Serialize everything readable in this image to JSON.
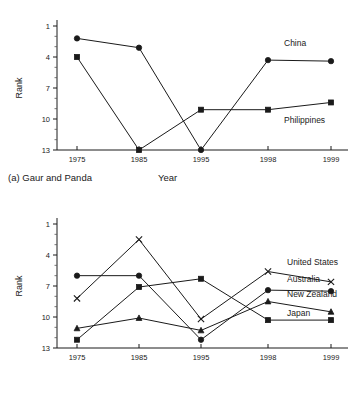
{
  "figure": {
    "axis_title_y": "Rank",
    "axis_title_x": "Year",
    "caption_a": "(a) Gaur and Panda",
    "caption_b": "(b) Elephants"
  },
  "chart_data": [
    {
      "type": "line",
      "title": "(a) Gaur and Panda",
      "xlabel": "Year",
      "ylabel": "Rank",
      "categories": [
        "1975",
        "1985",
        "1995",
        "1998",
        "1999"
      ],
      "yticks": [
        1,
        4,
        7,
        10,
        13
      ],
      "ylim": [
        13,
        1
      ],
      "y_inverted": true,
      "grid": false,
      "legend": "inline-right",
      "series": [
        {
          "name": "China",
          "marker": "filled-circle",
          "values": [
            2.2,
            3.1,
            13.0,
            4.3,
            4.4
          ]
        },
        {
          "name": "Philippines",
          "marker": "filled-square",
          "values": [
            4.0,
            13.0,
            9.1,
            9.1,
            8.4
          ]
        }
      ]
    },
    {
      "type": "line",
      "title": "(b) Elephants",
      "xlabel": "Year",
      "ylabel": "Rank",
      "categories": [
        "1975",
        "1985",
        "1995",
        "1998",
        "1999"
      ],
      "yticks": [
        1,
        4,
        7,
        10,
        13
      ],
      "ylim": [
        13,
        1
      ],
      "y_inverted": true,
      "grid": false,
      "legend": "inline-right",
      "series": [
        {
          "name": "United States",
          "marker": "cross",
          "values": [
            8.2,
            2.5,
            10.2,
            5.6,
            6.6
          ]
        },
        {
          "name": "Australia",
          "marker": "filled-circle",
          "values": [
            6.0,
            6.0,
            12.2,
            7.4,
            7.5
          ]
        },
        {
          "name": "New Zealand",
          "marker": "filled-triangle",
          "values": [
            11.1,
            10.1,
            11.3,
            8.5,
            9.5
          ]
        },
        {
          "name": "Japan",
          "marker": "filled-square",
          "values": [
            12.2,
            7.1,
            6.3,
            10.3,
            10.3
          ]
        }
      ]
    }
  ]
}
